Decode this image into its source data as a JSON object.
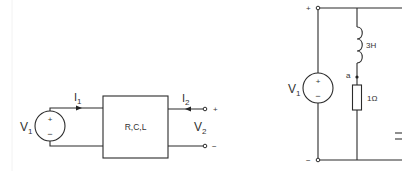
{
  "left_circuit": {
    "source_label": "V",
    "source_sub": "1",
    "source_plus": "+",
    "source_minus": "−",
    "current_in_label": "I",
    "current_in_sub": "1",
    "network_label": "R,C,L",
    "current_out_label": "I",
    "current_out_sub": "2",
    "output_voltage_label": "V",
    "output_voltage_sub": "2",
    "terminal_plus": "+",
    "terminal_minus": "−"
  },
  "right_circuit": {
    "source_label": "V",
    "source_sub": "1",
    "source_plus": "+",
    "source_minus": "−",
    "top_node_sign": "+",
    "bottom_node_sign": "−",
    "inductor_label": "3H",
    "node_label": "a",
    "resistor_label": "1Ω"
  }
}
